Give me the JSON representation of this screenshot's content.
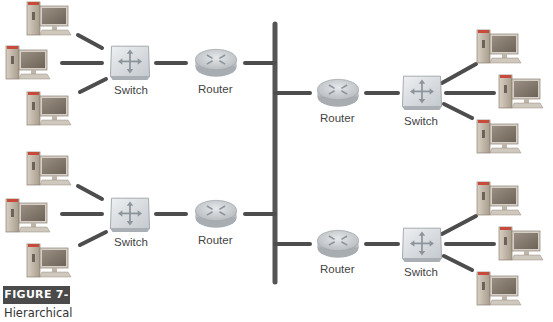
{
  "figure": {
    "label": "FIGURE 7-6",
    "caption": "Hierarchical"
  },
  "device_labels": {
    "switch": "Switch",
    "router": "Router"
  },
  "colors": {
    "link": "#4d4d4d",
    "backbone": "#555555",
    "badge_bg": "#4a4a4a"
  },
  "segments": [
    {
      "name": "upper-left",
      "computers": 3,
      "switch_label": "Switch",
      "router_label": "Router"
    },
    {
      "name": "lower-left",
      "computers": 3,
      "switch_label": "Switch",
      "router_label": "Router"
    },
    {
      "name": "upper-right",
      "computers": 3,
      "switch_label": "Switch",
      "router_label": "Router"
    },
    {
      "name": "lower-right",
      "computers": 3,
      "switch_label": "Switch",
      "router_label": "Router"
    }
  ]
}
